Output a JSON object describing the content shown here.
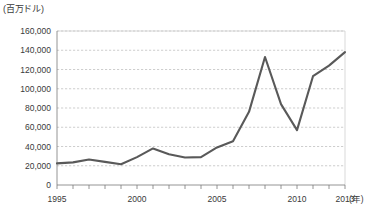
{
  "chart_data": {
    "type": "line",
    "title": "",
    "subtitle": "",
    "unit_label": "(百万ドル)",
    "xlabel": "(年)",
    "ylabel": "",
    "grid": true,
    "legend": "none",
    "xlim": [
      1995,
      2013
    ],
    "ylim": [
      0,
      160000
    ],
    "ytick_labels": [
      "160,000",
      "140,000",
      "120,000",
      "100,000",
      "80,000",
      "60,000",
      "40,000",
      "20,000",
      "0"
    ],
    "ytick_values": [
      160000,
      140000,
      120000,
      100000,
      80000,
      60000,
      40000,
      20000,
      0
    ],
    "xtick_labels": [
      "1995",
      "2000",
      "2005",
      "2010",
      "2013"
    ],
    "xtick_values": [
      1995,
      2000,
      2005,
      2010,
      2013
    ],
    "x": [
      1995,
      1996,
      1997,
      1998,
      1999,
      2000,
      2001,
      2002,
      2003,
      2004,
      2005,
      2006,
      2007,
      2008,
      2009,
      2010,
      2011,
      2012,
      2013
    ],
    "series": [
      {
        "name": "金額",
        "color": "#595959",
        "values": [
          22500,
          23500,
          26500,
          24000,
          21500,
          29000,
          38000,
          32000,
          28500,
          29000,
          39000,
          45500,
          76000,
          133000,
          84000,
          57000,
          113000,
          124000,
          138000
        ]
      }
    ]
  },
  "colors": {
    "line": "#595959",
    "grid": "#b9b9b9",
    "axis": "#7a7a7a",
    "text": "#3a3a3a",
    "background": "#ffffff"
  }
}
